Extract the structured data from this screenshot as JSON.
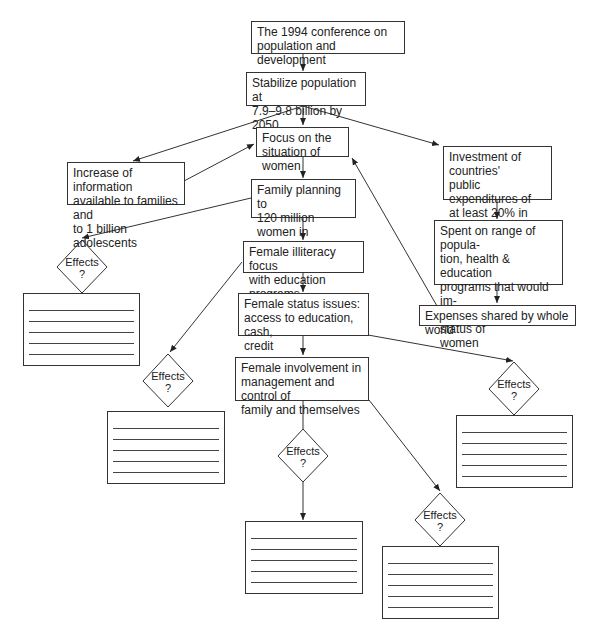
{
  "diagram": {
    "title": "The 1994 conference on population and development",
    "nodes": {
      "conference": {
        "lines": [
          "The 1994 conference on",
          "population and development"
        ]
      },
      "stabilize": {
        "lines": [
          "Stabilize population at",
          "7.9–9.8 billion by 2050"
        ]
      },
      "information": {
        "lines": [
          "Increase of information",
          "available to families and",
          "to 1 billion adolescents"
        ]
      },
      "focus": {
        "lines": [
          "Focus on the",
          "situation of women"
        ]
      },
      "investment": {
        "lines": [
          "Investment of countries'",
          "public expenditures of",
          "at least 20% in social",
          "sector"
        ]
      },
      "family_planning": {
        "lines": [
          "Family planning to",
          "120 million women in",
          "world"
        ]
      },
      "spent": {
        "lines": [
          "Spent on range of popula-",
          "tion, health & education",
          "programs that would im-",
          "prove health and status of",
          "women"
        ]
      },
      "illiteracy": {
        "lines": [
          "Female illiteracy focus",
          "with education programs"
        ]
      },
      "expenses": {
        "lines": [
          "Expenses shared by whole world"
        ]
      },
      "status": {
        "lines": [
          "Female status issues:",
          "access to education, cash,",
          "credit"
        ]
      },
      "involvement": {
        "lines": [
          "Female involvement in",
          "management and control of",
          "family and themselves"
        ]
      }
    },
    "effects": {
      "label": "Effects",
      "question": "?",
      "count": 5
    }
  }
}
